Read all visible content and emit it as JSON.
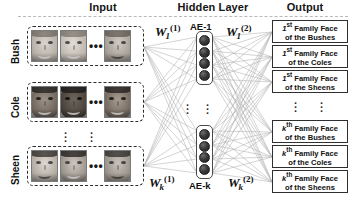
{
  "figure": {
    "headers": {
      "input": "Input",
      "hidden": "Hidden Layer",
      "output": "Output"
    },
    "input": {
      "row_labels": [
        "Bush",
        "Cole",
        "Sheen"
      ],
      "horizontal_ellipsis": "•••",
      "vertical_ellipsis": "⋮",
      "faces_per_group": 3
    },
    "hidden": {
      "blocks": [
        {
          "label": "AE-1",
          "label_position": "top",
          "nodes": 4
        },
        {
          "label": "AE-k",
          "label_position": "bottom",
          "nodes": 4
        }
      ],
      "vertical_ellipsis": "⋮"
    },
    "weights": [
      {
        "id": "w1-in",
        "base": "W",
        "sub": "1",
        "sup": "(1)"
      },
      {
        "id": "wk-in",
        "base": "W",
        "sub": "k",
        "sup": "(1)"
      },
      {
        "id": "w1-out",
        "base": "W",
        "sub": "1",
        "sup": "(2)"
      },
      {
        "id": "wk-out",
        "base": "W",
        "sub": "k",
        "sup": "(2)"
      }
    ],
    "output": {
      "boxes": [
        {
          "ordinal": "1",
          "ordinal_suffix": "st",
          "line1_tail": " Family Face",
          "line2": "of the Bushes"
        },
        {
          "ordinal": "1",
          "ordinal_suffix": "st",
          "line1_tail": " Family Face",
          "line2": "of the Coles"
        },
        {
          "ordinal": "1",
          "ordinal_suffix": "st",
          "line1_tail": " Family Face",
          "line2": "of the Sheens"
        },
        {
          "ordinal": "k",
          "ordinal_suffix": "th",
          "line1_tail": " Family Face",
          "line2": "of the Bushes"
        },
        {
          "ordinal": "k",
          "ordinal_suffix": "th",
          "line1_tail": " Family Face",
          "line2": "of the Coles"
        },
        {
          "ordinal": "k",
          "ordinal_suffix": "th",
          "line1_tail": " Family Face",
          "line2": "of the Sheens"
        }
      ],
      "vertical_ellipsis": "⋮"
    },
    "colors": {
      "edge": "#b0b0b0",
      "node": "#222222",
      "box_border": "#2f2f2f",
      "group_border": "#2b2b2b",
      "rule": "#b9b9b9"
    }
  }
}
